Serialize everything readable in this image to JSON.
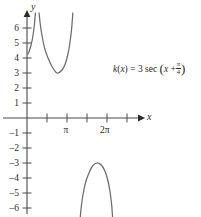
{
  "figure": {
    "title": "",
    "background_color": "#ffffff",
    "curve_color": "#6b6b6b",
    "axis_color": "#4a4a4a",
    "text_color": "#2b2b2b"
  },
  "axes": {
    "x_axis_name": "x",
    "y_axis_name": "y",
    "x_tick_labels": [
      {
        "text": "π",
        "x_value": 3.14159,
        "px": 67
      },
      {
        "text": "2π",
        "x_value": 6.28319,
        "px": 107
      }
    ],
    "y_tick_labels": [
      {
        "text": "6",
        "value": 6
      },
      {
        "text": "5",
        "value": 5
      },
      {
        "text": "4",
        "value": 4
      },
      {
        "text": "3",
        "value": 3
      },
      {
        "text": "2",
        "value": 2
      },
      {
        "text": "1",
        "value": 1
      },
      {
        "text": "–1",
        "value": -1
      },
      {
        "text": "–2",
        "value": -2
      },
      {
        "text": "–3",
        "value": -3
      },
      {
        "text": "–4",
        "value": -4
      },
      {
        "text": "–5",
        "value": -5
      },
      {
        "text": "–6",
        "value": -6
      }
    ]
  },
  "annotation": {
    "function_name": "k",
    "variable": "x",
    "equals": "=",
    "amplitude": "3",
    "trig": "sec",
    "open_paren": "(",
    "inner_variable": "x",
    "plus": "+",
    "fraction_numerator": "π",
    "fraction_denominator": "4",
    "close_paren": ")",
    "full_text": "k(x) = 3 sec (x + π/4)"
  },
  "chart_data": {
    "type": "line",
    "title": "",
    "xlabel": "x",
    "ylabel": "y",
    "xlim": [
      -0.5,
      7.3
    ],
    "ylim": [
      -6.6,
      6.6
    ],
    "grid": false,
    "legend": null,
    "function": "k(x) = 3 sec(x + pi/4)",
    "amplitude": 3,
    "phase_shift": -0.7853981634,
    "period": 6.2831853072,
    "vertical_asymptotes": [
      0.7853981634,
      3.926990817
    ],
    "local_extrema": [
      {
        "x": 2.3561944902,
        "y": 3,
        "type": "local-minimum"
      },
      {
        "x": 5.4977871438,
        "y": -3,
        "type": "local-maximum"
      },
      {
        "x": -0.7853981634,
        "y": 3,
        "type": "local-minimum"
      }
    ],
    "series": [
      {
        "name": "branch-left-partial",
        "comment": "sliver left of the first asymptote, hugging the y-axis, visible from y=4 up past y=6",
        "points": [
          [
            0.05,
            4.25
          ],
          [
            0.15,
            4.4
          ],
          [
            0.3,
            4.8
          ],
          [
            0.45,
            5.4
          ],
          [
            0.58,
            6.2
          ],
          [
            0.66,
            7.0
          ]
        ]
      },
      {
        "name": "branch-upper",
        "comment": "U-shaped branch between the asymptotes, vertex at (3pi/4, 3)",
        "points": [
          [
            0.95,
            7.0
          ],
          [
            1.05,
            6.2
          ],
          [
            1.2,
            5.4
          ],
          [
            1.4,
            4.6
          ],
          [
            1.65,
            4.0
          ],
          [
            1.95,
            3.45
          ],
          [
            2.35,
            3.0
          ],
          [
            2.75,
            3.2
          ],
          [
            3.0,
            3.6
          ],
          [
            3.2,
            4.2
          ],
          [
            3.35,
            4.9
          ],
          [
            3.5,
            5.9
          ],
          [
            3.6,
            7.0
          ]
        ]
      },
      {
        "name": "branch-lower",
        "comment": "inverted U branch below the x-axis, vertex at (7pi/4, -3)",
        "points": [
          [
            4.15,
            -7.0
          ],
          [
            4.25,
            -6.0
          ],
          [
            4.4,
            -5.1
          ],
          [
            4.6,
            -4.3
          ],
          [
            4.85,
            -3.7
          ],
          [
            5.15,
            -3.2
          ],
          [
            5.5,
            -3.0
          ],
          [
            5.85,
            -3.15
          ],
          [
            6.1,
            -3.5
          ],
          [
            6.3,
            -4.0
          ],
          [
            6.5,
            -4.8
          ],
          [
            6.65,
            -5.8
          ],
          [
            6.75,
            -7.0
          ]
        ]
      }
    ]
  }
}
